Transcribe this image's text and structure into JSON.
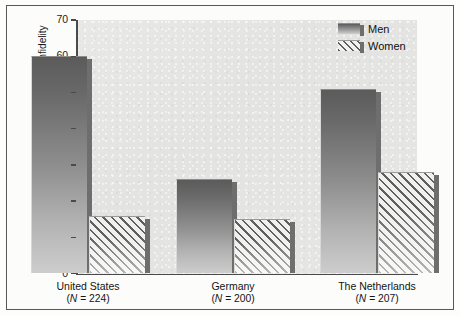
{
  "chart_data": {
    "type": "bar",
    "title": "",
    "xlabel": "",
    "ylabel": "Percentage reporting more distress to sexual infidelity",
    "ylim": [
      0,
      70
    ],
    "yticks": [
      0,
      10,
      20,
      30,
      40,
      50,
      60,
      70
    ],
    "grid": false,
    "legend_position": "top-right",
    "categories": [
      "United States",
      "Germany",
      "The Netherlands"
    ],
    "category_sublabels": [
      "(N = 224)",
      "(N = 200)",
      "(N = 207)"
    ],
    "category_n": [
      224,
      200,
      207
    ],
    "series": [
      {
        "name": "Men",
        "values": [
          60,
          26,
          51
        ],
        "style": "solid-gradient"
      },
      {
        "name": "Women",
        "values": [
          16,
          15,
          28
        ],
        "style": "diagonal-hatch"
      }
    ],
    "colors": {
      "bar_men_top": "#5b5b5b",
      "bar_men_bottom": "#cdcdcd",
      "bar_women_hatch": "#5f5f5f",
      "bar_women_fill": "#f0f0ee",
      "bar_shadow": "#6e6e6e",
      "plot_background": "#e5e5e3",
      "axis": "#4a4a4a",
      "frame": "#585858",
      "text": "#141414"
    }
  },
  "legend": {
    "items": [
      {
        "label": "Men",
        "swatch": "men-swatch"
      },
      {
        "label": "Women",
        "swatch": "women-swatch"
      }
    ]
  },
  "axis": {
    "y_title": "Percentage reporting more distress to sexual infidelity",
    "y_ticks": [
      "70",
      "60",
      "50",
      "40",
      "30",
      "20",
      "10",
      "0"
    ]
  },
  "categories": [
    {
      "name": "United States",
      "n_label": "N = 224"
    },
    {
      "name": "Germany",
      "n_label": "N = 200"
    },
    {
      "name": "The Netherlands",
      "n_label": "N = 207"
    }
  ]
}
